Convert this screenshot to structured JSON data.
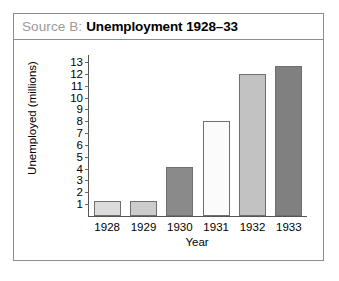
{
  "source_box": {
    "label": "Source B:",
    "title": "Unemployment 1928–33"
  },
  "chart_data": {
    "type": "bar",
    "title": "Unemployment 1928–33",
    "xlabel": "Year",
    "ylabel": "Unemployed (millions)",
    "categories": [
      "1928",
      "1929",
      "1930",
      "1931",
      "1932",
      "1933"
    ],
    "values": [
      1.3,
      1.3,
      4.1,
      8.0,
      12.0,
      12.7
    ],
    "bar_colors": [
      "#dcdcdc",
      "#cccccc",
      "#8a8a8a",
      "#fbfbfb",
      "#c2c2c2",
      "#808080"
    ],
    "ylim": [
      0,
      13.6
    ],
    "yticks": [
      1,
      2,
      3,
      4,
      5,
      6,
      7,
      8,
      9,
      10,
      11,
      12,
      13
    ],
    "ytick_labels": [
      "1",
      "2",
      "3",
      "4",
      "5",
      "6",
      "7",
      "8",
      "9",
      "10",
      "11",
      "12",
      "13"
    ],
    "grid": false,
    "legend": "none"
  }
}
